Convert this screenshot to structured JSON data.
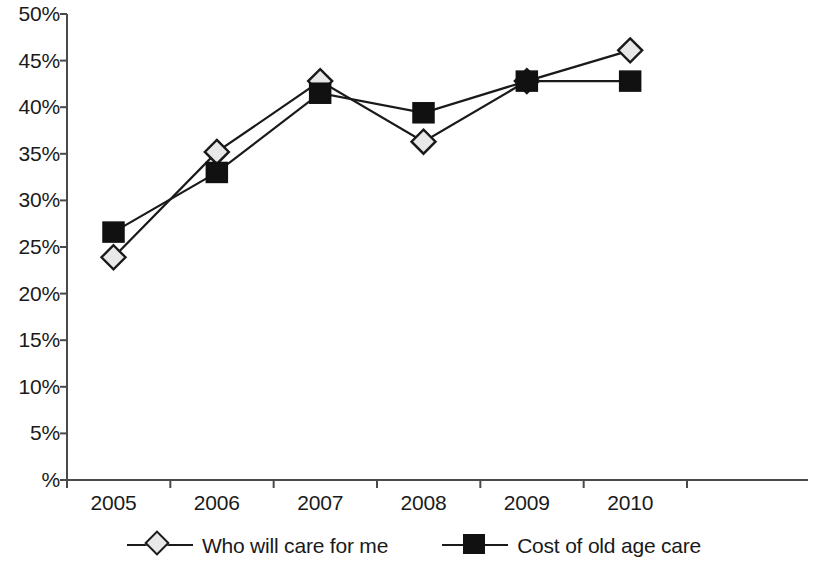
{
  "chart_data": {
    "type": "line",
    "title": "",
    "subtitle": "",
    "xlabel": "",
    "ylabel": "",
    "categories": [
      "2005",
      "2006",
      "2007",
      "2008",
      "2009",
      "2010"
    ],
    "series": [
      {
        "name": "Who will care for me",
        "marker": "diamond-open",
        "color": "#e8e8e8",
        "line_color": "#1a1a1a",
        "values": [
          23.9,
          35.2,
          42.8,
          36.3,
          42.8,
          46.1
        ]
      },
      {
        "name": "Cost of old age care",
        "marker": "square-filled",
        "color": "#111111",
        "line_color": "#1a1a1a",
        "values": [
          26.6,
          33.0,
          41.5,
          39.4,
          42.8,
          42.8
        ]
      }
    ],
    "ylim": [
      0,
      50
    ],
    "ytick_values": [
      0,
      5,
      10,
      15,
      20,
      25,
      30,
      35,
      40,
      45,
      50
    ],
    "ytick_labels": [
      "%",
      "5%",
      "10%",
      "15%",
      "20%",
      "25%",
      "30%",
      "35%",
      "40%",
      "45%",
      "50%"
    ],
    "xtick_labels": [
      "2005",
      "2006",
      "2007",
      "2008",
      "2009",
      "2010"
    ],
    "grid": false,
    "legend_position": "bottom"
  },
  "legend": {
    "items": [
      {
        "label": "Who will care for me",
        "marker": "diamond-open"
      },
      {
        "label": "Cost of old age care",
        "marker": "square-filled"
      }
    ]
  }
}
